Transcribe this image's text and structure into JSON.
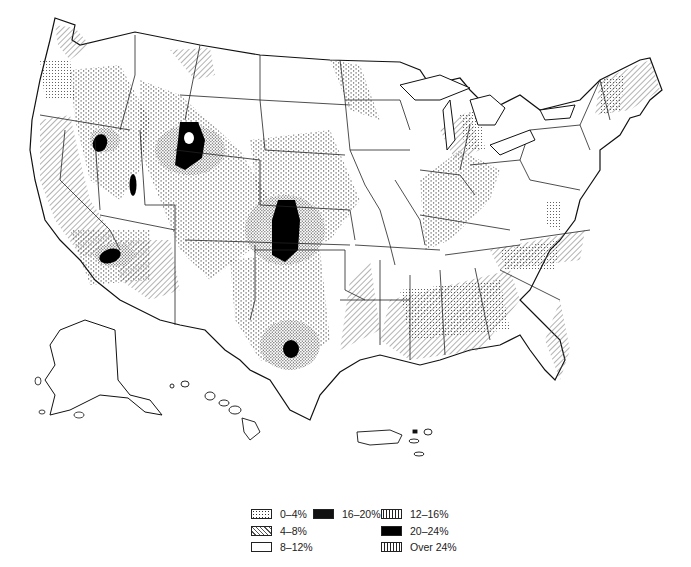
{
  "map": {
    "subject": "United States thematic map (contiguous states, Alaska, Hawaii, Puerto Rico)",
    "regions_highlighted": {
      "20-24%": [
        "NE Nevada",
        "NW Wyoming/Idaho border",
        "E Nevada/Utah",
        "S Nevada/Arizona/California border",
        "E Colorado/W Kansas",
        "Central Texas"
      ],
      "white_hole_in": "NW Wyoming black region"
    },
    "colors": {
      "ink": "#111111",
      "background": "#ffffff",
      "hatch": "#555555"
    }
  },
  "legend": {
    "items": [
      {
        "label": "0–4%",
        "pattern": "dots"
      },
      {
        "label": "4–8%",
        "pattern": "diagonal-hatch"
      },
      {
        "label": "8–12%",
        "pattern": "white"
      },
      {
        "label": "16–20%",
        "pattern": "dense-stipple"
      },
      {
        "label": "12–16%",
        "pattern": "sparse-stipple"
      },
      {
        "label": "20–24%",
        "pattern": "solid-black"
      },
      {
        "label": "Over 24%",
        "pattern": "vertical-lines"
      }
    ]
  }
}
